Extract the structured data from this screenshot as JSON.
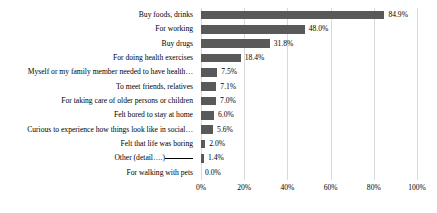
{
  "chart_data": {
    "type": "bar",
    "orientation": "horizontal",
    "title": "",
    "xlabel": "",
    "ylabel": "",
    "xlim": [
      0,
      100
    ],
    "xticks": [
      "0%",
      "20%",
      "40%",
      "60%",
      "80%",
      "100%"
    ],
    "xtick_values": [
      0,
      20,
      40,
      60,
      80,
      100
    ],
    "grid": true,
    "legend": false,
    "bar_color": "#595959",
    "gridline_color": "#d9d9d9",
    "categories": [
      "Buy foods, drinks",
      "For working",
      "Buy drugs",
      "For doing health exercises",
      "Myself or my family member needed to have health…",
      "To meet friends, relatives",
      "For taking care of older persons or children",
      "Felt bored to stay at home",
      "Curious to experience how things look like in social…",
      "Felt that life was boring",
      "Other (detail….)",
      "For walking with pets"
    ],
    "values": [
      84.9,
      48.0,
      31.8,
      18.4,
      7.5,
      7.1,
      7.0,
      6.0,
      5.6,
      2.0,
      1.4,
      0.0
    ],
    "data_labels": [
      "84.9%",
      "48.0%",
      "31.8%",
      "18.4%",
      "7.5%",
      "7.1%",
      "7.0%",
      "6.0%",
      "5.6%",
      "2.0%",
      "1.4%",
      "0.0%"
    ],
    "category_has_blank_line": [
      false,
      false,
      false,
      false,
      false,
      false,
      false,
      false,
      false,
      false,
      true,
      false
    ]
  }
}
